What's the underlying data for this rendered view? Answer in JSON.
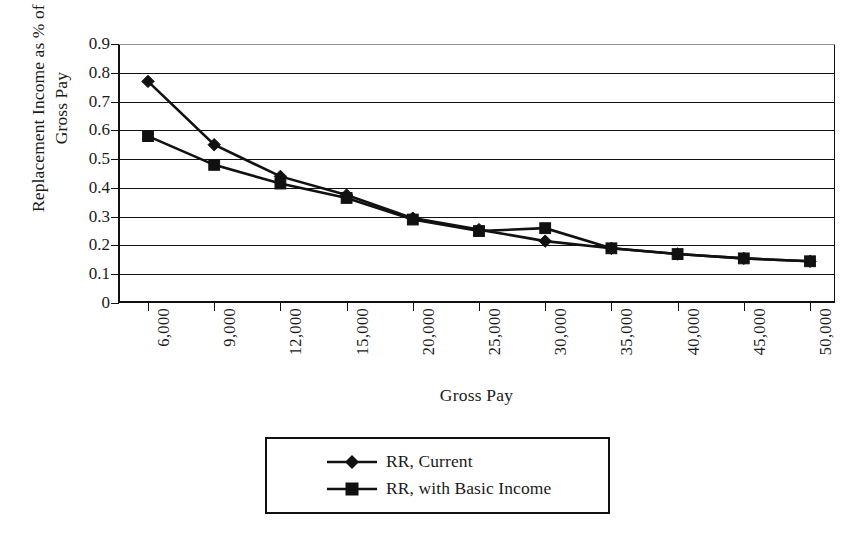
{
  "chart_data": {
    "type": "line",
    "title": "",
    "xlabel": "Gross Pay",
    "ylabel": "Replacement Income as % of\nGross Pay",
    "categories": [
      "6,000",
      "9,000",
      "12,000",
      "15,000",
      "20,000",
      "25,000",
      "30,000",
      "35,000",
      "40,000",
      "45,000",
      "50,000"
    ],
    "x_values": [
      6000,
      9000,
      12000,
      15000,
      20000,
      25000,
      30000,
      35000,
      40000,
      45000,
      50000
    ],
    "ylim": [
      0,
      0.9
    ],
    "y_ticks": [
      "0",
      "0.1",
      "0.2",
      "0.3",
      "0.4",
      "0.5",
      "0.6",
      "0.7",
      "0.8",
      "0.9"
    ],
    "y_tick_values": [
      0,
      0.1,
      0.2,
      0.3,
      0.4,
      0.5,
      0.6,
      0.7,
      0.8,
      0.9
    ],
    "grid": "horizontal",
    "legend_position": "below-plot",
    "series": [
      {
        "name": "RR, Current",
        "marker": "diamond",
        "values": [
          0.77,
          0.55,
          0.44,
          0.375,
          0.295,
          0.255,
          0.215,
          0.19,
          0.17,
          0.155,
          0.145
        ]
      },
      {
        "name": "RR, with Basic Income",
        "marker": "square",
        "values": [
          0.58,
          0.48,
          0.415,
          0.365,
          0.29,
          0.25,
          0.26,
          0.19,
          0.17,
          0.155,
          0.145
        ]
      }
    ]
  },
  "legend": {
    "items": [
      {
        "label": "RR, Current",
        "marker": "diamond"
      },
      {
        "label": "RR, with Basic Income",
        "marker": "square"
      }
    ]
  },
  "colors": {
    "series_line": "#111111",
    "axis": "#111111",
    "grid": "#111111",
    "background": "#ffffff"
  }
}
